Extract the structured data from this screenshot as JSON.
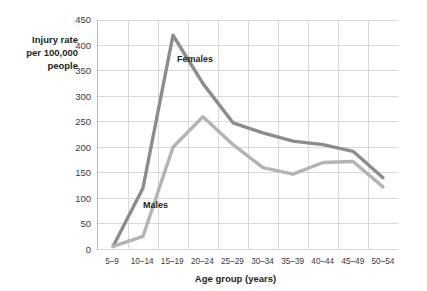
{
  "figure": {
    "y_axis_title": "Injury rate\nper 100,000\npeople",
    "x_axis_title": "Age group (years)",
    "label_females": "Females",
    "label_males": "Males"
  },
  "colors": {
    "females_line": "#8c8c8c",
    "males_line": "#b3b3b3",
    "grid": "#d9d9d9",
    "axis": "#b8b8b8",
    "text": "#231f20",
    "background": "#ffffff"
  },
  "chart_data": {
    "type": "line",
    "title": "",
    "subtitle": "",
    "xlabel": "Age group (years)",
    "ylabel": "Injury rate per 100,000 people",
    "categories": [
      "5–9",
      "10–14",
      "15–19",
      "20–24",
      "25–29",
      "30–34",
      "35–39",
      "40–44",
      "45–49",
      "50–54"
    ],
    "x_tick_labels": [
      "5–9",
      "10–14",
      "15–19",
      "20–24",
      "25–29",
      "30–34",
      "35–39",
      "40–44",
      "45–49",
      "50–54"
    ],
    "y_tick_labels": [
      "0",
      "50",
      "100",
      "150",
      "200",
      "250",
      "300",
      "350",
      "400",
      "450"
    ],
    "y_ticks": [
      0,
      50,
      100,
      150,
      200,
      250,
      300,
      350,
      400,
      450
    ],
    "ylim": [
      0,
      450
    ],
    "ytick_step": 50,
    "grid": "horizontal-and-vertical",
    "legend": "inline-annotations",
    "series": [
      {
        "name": "Females",
        "color": "#8c8c8c",
        "values": [
          5,
          120,
          420,
          325,
          248,
          228,
          212,
          205,
          192,
          140
        ]
      },
      {
        "name": "Males",
        "color": "#b3b3b3",
        "values": [
          5,
          25,
          200,
          260,
          205,
          160,
          147,
          170,
          172,
          122
        ]
      }
    ],
    "annotations": [
      {
        "text": "Females",
        "series": "Females"
      },
      {
        "text": "Males",
        "series": "Males"
      }
    ]
  }
}
